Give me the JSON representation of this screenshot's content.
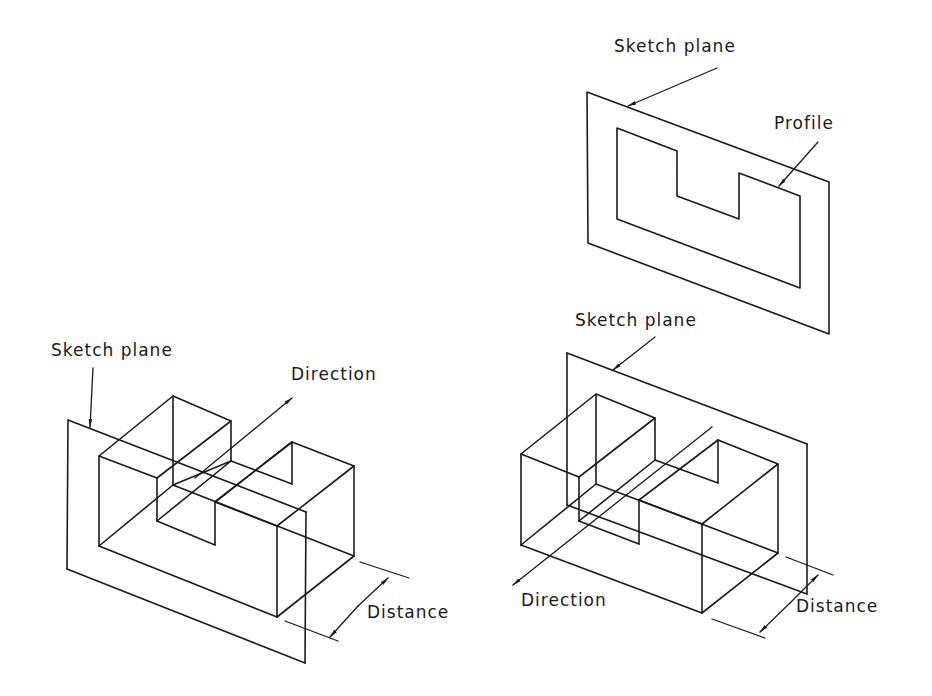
{
  "figure": {
    "top_diagram": {
      "labels": {
        "sketch_plane": "Sketch plane",
        "profile": "Profile"
      }
    },
    "left_diagram": {
      "labels": {
        "sketch_plane": "Sketch plane",
        "direction": "Direction",
        "distance": "Distance"
      }
    },
    "right_diagram": {
      "labels": {
        "sketch_plane": "Sketch plane",
        "direction": "Direction",
        "distance": "Distance"
      }
    },
    "colors": {
      "line": "#1a1a1a",
      "background": "#ffffff"
    }
  }
}
